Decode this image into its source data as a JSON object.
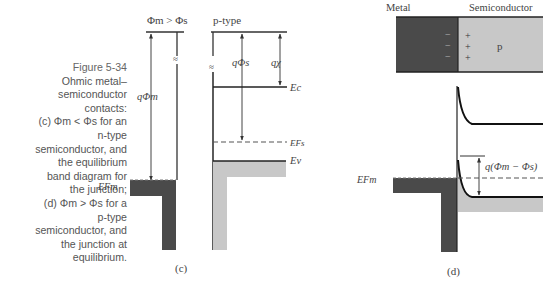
{
  "caption": {
    "lines": [
      "Figure 5-34",
      "Ohmic metal–",
      "semiconductor",
      "contacts:",
      "(c) Φm < Φs for an",
      "n-type",
      "semiconductor, and",
      "the equilibrium",
      "band diagram for",
      "the junction;",
      "(d) Φm > Φs for a",
      "p-type",
      "semiconductor, and",
      "the junction at",
      "equilibrium."
    ]
  },
  "panel_c": {
    "condition": "Φm > Φs",
    "type_label": "p-type",
    "q_phi_m": "qΦm",
    "q_phi_s": "qΦs",
    "q_chi": "qχ",
    "ec": "Ec",
    "efs": "EFs",
    "ev": "Ev",
    "efm": "EFm",
    "label": "(c)"
  },
  "panel_d": {
    "metal_label": "Metal",
    "semiconductor_label": "Semiconductor",
    "minus_signs": [
      "−",
      "−",
      "−"
    ],
    "plus_signs": [
      "+",
      "+",
      "+"
    ],
    "region_label": "p",
    "efm": "EFm",
    "barrier": "q(Φm − Φs)",
    "label": "(d)"
  },
  "colors": {
    "metal_dark": "#4a4a4a",
    "semiconductor_light": "#c8c8c8",
    "line": "#222222"
  }
}
